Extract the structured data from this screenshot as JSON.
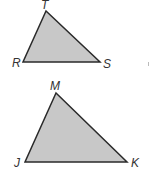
{
  "diagram": {
    "triangles": [
      {
        "name": "RST",
        "fill": "#c8c8c8",
        "stroke": "#2a2a2a",
        "vertices": [
          {
            "label": "T",
            "x": 46,
            "y": 11,
            "lx": 41,
            "ly": 9
          },
          {
            "label": "R",
            "x": 23,
            "y": 62,
            "lx": 12,
            "ly": 67
          },
          {
            "label": "S",
            "x": 100,
            "y": 62,
            "lx": 103,
            "ly": 68
          }
        ]
      },
      {
        "name": "MJK",
        "fill": "#c8c8c8",
        "stroke": "#2a2a2a",
        "vertices": [
          {
            "label": "M",
            "x": 56,
            "y": 93,
            "lx": 50,
            "ly": 90
          },
          {
            "label": "J",
            "x": 25,
            "y": 162,
            "lx": 14,
            "ly": 167
          },
          {
            "label": "K",
            "x": 127,
            "y": 162,
            "lx": 131,
            "ly": 167
          }
        ]
      }
    ],
    "labels": {
      "T": "T",
      "R": "R",
      "S": "S",
      "M": "M",
      "J": "J",
      "K": "K"
    }
  }
}
